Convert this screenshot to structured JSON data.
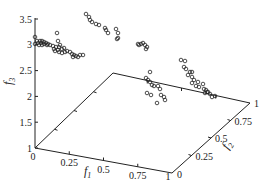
{
  "chart_data": {
    "type": "scatter",
    "projection": "3d",
    "title": "",
    "axes": {
      "f1": {
        "label": "f1",
        "range": [
          0,
          1
        ],
        "ticks": [
          "0",
          "0.25",
          "0.5",
          "0.75",
          "1"
        ]
      },
      "f2": {
        "label": "f2",
        "range": [
          0,
          1
        ],
        "ticks": [
          "0",
          "0.25",
          "0.5",
          "0.75",
          "1"
        ]
      },
      "f3": {
        "label": "f3",
        "range": [
          1,
          3.5
        ],
        "ticks": [
          "1",
          "1.5",
          "2",
          "2.5",
          "3",
          "3.5"
        ]
      }
    },
    "grid": false,
    "legend": null,
    "marker": "open-circle",
    "series": [
      {
        "name": "solutions",
        "points_screen": [
          [
            35,
            37
          ],
          [
            35,
            44
          ],
          [
            37,
            41
          ],
          [
            40,
            41
          ],
          [
            42,
            41
          ],
          [
            44,
            42
          ],
          [
            38,
            43
          ],
          [
            41,
            43
          ],
          [
            46,
            43
          ],
          [
            48,
            44
          ],
          [
            50,
            45
          ],
          [
            53,
            46
          ],
          [
            56,
            47
          ],
          [
            47,
            45
          ],
          [
            44,
            44
          ],
          [
            39,
            45
          ],
          [
            42,
            45
          ],
          [
            57,
            33
          ],
          [
            58,
            41
          ],
          [
            59,
            47
          ],
          [
            62,
            49
          ],
          [
            64,
            48
          ],
          [
            67,
            51
          ],
          [
            70,
            52
          ],
          [
            72,
            54
          ],
          [
            74,
            55
          ],
          [
            76,
            56
          ],
          [
            73,
            57
          ],
          [
            78,
            57
          ],
          [
            80,
            55
          ],
          [
            83,
            55
          ],
          [
            59,
            52
          ],
          [
            62,
            53
          ],
          [
            65,
            52
          ],
          [
            55,
            51
          ],
          [
            58,
            50
          ],
          [
            54,
            49
          ],
          [
            60,
            45
          ],
          [
            86,
            14
          ],
          [
            89,
            17
          ],
          [
            90,
            20
          ],
          [
            92,
            22
          ],
          [
            96,
            24
          ],
          [
            99,
            25
          ],
          [
            105,
            28
          ],
          [
            106,
            30
          ],
          [
            108,
            33
          ],
          [
            116,
            29
          ],
          [
            118,
            33
          ],
          [
            118,
            38
          ],
          [
            117,
            39
          ],
          [
            138,
            44
          ],
          [
            139,
            45
          ],
          [
            141,
            44
          ],
          [
            143,
            43
          ],
          [
            145,
            45
          ],
          [
            147,
            47
          ],
          [
            146,
            49
          ],
          [
            150,
            72
          ],
          [
            146,
            78
          ],
          [
            148,
            80
          ],
          [
            150,
            82
          ],
          [
            152,
            85
          ],
          [
            154,
            86
          ],
          [
            158,
            86
          ],
          [
            160,
            89
          ],
          [
            147,
            93
          ],
          [
            151,
            95
          ],
          [
            161,
            95
          ],
          [
            164,
            97
          ],
          [
            165,
            100
          ],
          [
            157,
            103
          ],
          [
            181,
            60
          ],
          [
            185,
            61
          ],
          [
            184,
            67
          ],
          [
            186,
            69
          ],
          [
            190,
            72
          ],
          [
            192,
            72
          ],
          [
            188,
            75
          ],
          [
            192,
            77
          ],
          [
            194,
            80
          ],
          [
            192,
            83
          ],
          [
            196,
            86
          ],
          [
            199,
            87
          ],
          [
            198,
            82
          ],
          [
            203,
            84
          ],
          [
            204,
            89
          ],
          [
            206,
            90
          ],
          [
            207,
            92
          ],
          [
            210,
            94
          ],
          [
            212,
            97
          ],
          [
            208,
            92
          ],
          [
            205,
            93
          ],
          [
            215,
            96
          ]
        ]
      }
    ]
  },
  "labels": {
    "f1": "f",
    "f1_sub": "1",
    "f2": "f",
    "f2_sub": "2",
    "f3": "f",
    "f3_sub": "3",
    "f3_ticks": [
      "1",
      "1.5",
      "2",
      "2.5",
      "3",
      "3.5"
    ],
    "f1_ticks": [
      "0",
      "0.25",
      "0.5",
      "0.75",
      "1"
    ],
    "f2_ticks": [
      "0",
      "0.25",
      "0.5",
      "0.75",
      "1"
    ]
  }
}
